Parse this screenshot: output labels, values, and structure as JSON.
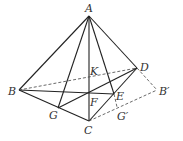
{
  "diagram": {
    "type": "geometry-3d-tetrahedron",
    "points": {
      "A": {
        "label": "A",
        "x": 89,
        "y": 16
      },
      "B": {
        "label": "B",
        "x": 19,
        "y": 90
      },
      "C": {
        "label": "C",
        "x": 89,
        "y": 121
      },
      "D": {
        "label": "D",
        "x": 137,
        "y": 68
      },
      "G": {
        "label": "G",
        "x": 58,
        "y": 108
      },
      "E": {
        "label": "E",
        "x": 114,
        "y": 94
      },
      "F": {
        "label": "F",
        "x": 89,
        "y": 93
      },
      "K": {
        "label": "K",
        "x": 89,
        "y": 77
      },
      "B'": {
        "label": "B′",
        "x": 157,
        "y": 90
      },
      "G'": {
        "label": "G′",
        "x": 117,
        "y": 107
      }
    },
    "solid_segments": [
      [
        "A",
        "B"
      ],
      [
        "A",
        "C"
      ],
      [
        "A",
        "D"
      ],
      [
        "A",
        "G"
      ],
      [
        "A",
        "E"
      ],
      [
        "B",
        "C"
      ],
      [
        "C",
        "D"
      ],
      [
        "B",
        "E"
      ],
      [
        "G",
        "D"
      ]
    ],
    "dashed_segments": [
      [
        "B",
        "D"
      ],
      [
        "D",
        "B'"
      ],
      [
        "C",
        "B'"
      ],
      [
        "E",
        "G'"
      ]
    ],
    "labels": {
      "A": "A",
      "B": "B",
      "C": "C",
      "D": "D",
      "G": "G",
      "E": "E",
      "F": "F",
      "K": "K",
      "Bp": "B′",
      "Gp": "G′"
    }
  }
}
